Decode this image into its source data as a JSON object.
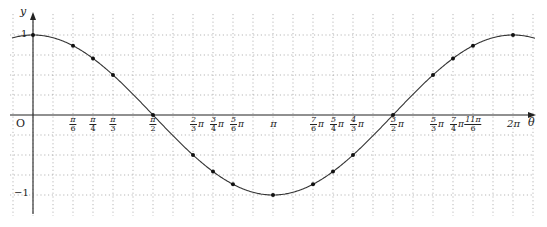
{
  "chart_data": {
    "type": "line",
    "title": "",
    "function": "y = cos θ",
    "xlabel": "θ",
    "ylabel": "y",
    "origin_label": "O",
    "xlim_radians": [
      -0.524,
      2.094
    ],
    "xlim_units_pi": [
      -0.083,
      2.083
    ],
    "ylim": [
      -1.1,
      1.2
    ],
    "grid": true,
    "grid_x_step_pi": 0.0833,
    "grid_y_step": 0.25,
    "y_ticks": [
      {
        "value": 1,
        "label": "1"
      },
      {
        "value": -1,
        "label": "−1"
      }
    ],
    "x_ticks": [
      {
        "pi": 0.1667,
        "num": "π",
        "den": "6",
        "coef": false
      },
      {
        "pi": 0.25,
        "num": "π",
        "den": "4",
        "coef": false
      },
      {
        "pi": 0.3333,
        "num": "π",
        "den": "3",
        "coef": false
      },
      {
        "pi": 0.5,
        "num": "π",
        "den": "2",
        "coef": false
      },
      {
        "pi": 0.6667,
        "num": "2",
        "den": "3",
        "coef": true
      },
      {
        "pi": 0.75,
        "num": "3",
        "den": "4",
        "coef": true
      },
      {
        "pi": 0.8333,
        "num": "5",
        "den": "6",
        "coef": true
      },
      {
        "pi": 1.0,
        "label": "π"
      },
      {
        "pi": 1.1667,
        "num": "7",
        "den": "6",
        "coef": true
      },
      {
        "pi": 1.25,
        "num": "5",
        "den": "4",
        "coef": true
      },
      {
        "pi": 1.3333,
        "num": "4",
        "den": "3",
        "coef": true
      },
      {
        "pi": 1.5,
        "num": "3",
        "den": "2",
        "coef": true
      },
      {
        "pi": 1.6667,
        "num": "5",
        "den": "3",
        "coef": true
      },
      {
        "pi": 1.75,
        "num": "7",
        "den": "4",
        "coef": true
      },
      {
        "pi": 1.8333,
        "num": "11π",
        "den": "6",
        "coef": false
      },
      {
        "pi": 2.0,
        "label": "2π"
      }
    ],
    "series": [
      {
        "name": "cos θ",
        "x_pi": [
          0,
          0.1667,
          0.25,
          0.3333,
          0.5,
          0.6667,
          0.75,
          0.8333,
          1.0,
          1.1667,
          1.25,
          1.3333,
          1.5,
          1.6667,
          1.75,
          1.8333,
          2.0
        ],
        "values": [
          1,
          0.866,
          0.707,
          0.5,
          0,
          -0.5,
          -0.707,
          -0.866,
          -1,
          -0.866,
          -0.707,
          -0.5,
          0,
          0.5,
          0.707,
          0.866,
          1
        ],
        "markers": true
      }
    ]
  },
  "colors": {
    "curve": "#333333",
    "axis": "#222222",
    "grid": "#9a9a9a"
  }
}
